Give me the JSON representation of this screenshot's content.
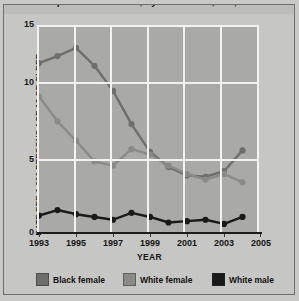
{
  "figure": {
    "title": "Rate of rape/sexual assault, by victim race, sex, 1993-2004",
    "y_axis_title": "RATE PER 1,000 PERSONS AGE 12 OR OLDER",
    "x_axis_title": "YEAR",
    "plot_bg_color": "#a9a9a7",
    "grid_color": "#f2f2f0",
    "axis_color": "#1c1c1c"
  },
  "axes": {
    "y_ticks": [
      "0",
      "5",
      "10",
      "15"
    ],
    "x_ticks": [
      "1993",
      "1995",
      "1997",
      "1999",
      "2001",
      "2003",
      "2005"
    ]
  },
  "legend": [
    {
      "label": "Black female",
      "color": "#6e6e6c"
    },
    {
      "label": "White female",
      "color": "#8a8a88"
    },
    {
      "label": "White male",
      "color": "#1a1a1a"
    }
  ],
  "chart_data": {
    "type": "line",
    "title": "Rate of rape/sexual assault, by victim race, sex, 1993-2004",
    "xlabel": "YEAR",
    "ylabel": "RATE PER 1,000 PERSONS AGE 12 OR OLDER",
    "xlim": [
      1993,
      2005
    ],
    "ylim": [
      0,
      15
    ],
    "grid": true,
    "legend_position": "bottom",
    "x": [
      1993,
      1994,
      1995,
      1996,
      1997,
      1998,
      1999,
      2000,
      2001,
      2002,
      2003,
      2004
    ],
    "series": [
      {
        "name": "Black female",
        "color": "#6e6e6c",
        "values": [
          12.4,
          12.9,
          13.5,
          12.2,
          10.4,
          8.0,
          6.0,
          4.9,
          4.3,
          4.2,
          4.6,
          6.1
        ]
      },
      {
        "name": "White female",
        "color": "#8a8a88",
        "values": [
          10.0,
          8.2,
          6.8,
          5.3,
          5.0,
          6.2,
          5.8,
          5.0,
          4.4,
          4.0,
          4.4,
          3.8
        ]
      },
      {
        "name": "White male",
        "color": "#1a1a1a",
        "values": [
          1.4,
          1.8,
          1.5,
          1.3,
          1.1,
          1.6,
          1.3,
          0.9,
          1.0,
          1.1,
          0.8,
          1.3
        ]
      }
    ]
  }
}
